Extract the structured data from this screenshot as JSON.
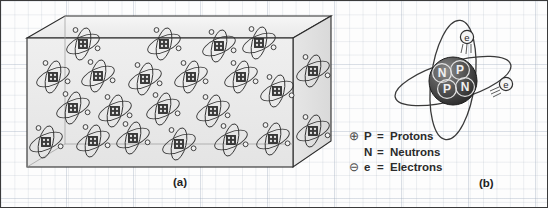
{
  "figure": {
    "background": {
      "style": "graph-paper-grid",
      "paper_color": "#fdfdfd",
      "grid_color": "#aab4c3",
      "border_color": "#3a3a3a"
    },
    "panels": [
      {
        "id": "a",
        "label": "(a)",
        "description": "Three-dimensional block of material filled with atoms",
        "shape": "rectangular-box-perspective",
        "fill_color": "#ececec",
        "edge_color": "#2b2b2b",
        "atom_count_front": 20,
        "atom_count_side": 2,
        "atom": {
          "nucleus_shape": "square",
          "nucleus_color": "#2f2f2f",
          "orbit_count": 2,
          "electron_count": 2
        }
      },
      {
        "id": "b",
        "label": "(b)",
        "description": "Single atom showing nucleus with protons and neutrons plus orbiting electrons",
        "nucleus": {
          "shape": "sphere",
          "color": "#3d3d3d",
          "particles": [
            {
              "symbol": "N",
              "row": 0,
              "col": 0
            },
            {
              "symbol": "P",
              "row": 0,
              "col": 1
            },
            {
              "symbol": "P",
              "row": 1,
              "col": 0
            },
            {
              "symbol": "N",
              "row": 1,
              "col": 1
            }
          ]
        },
        "electrons": [
          {
            "symbol": "e",
            "position": "upper"
          },
          {
            "symbol": "e",
            "position": "right"
          }
        ],
        "orbit_count": 2
      }
    ],
    "legend": {
      "items": [
        {
          "icon": "circle-plus-icon",
          "glyph": "⊕",
          "symbol": "P",
          "equals": "=",
          "name": "Protons"
        },
        {
          "icon": "none",
          "glyph": "",
          "symbol": "N",
          "equals": "=",
          "name": "Neutrons"
        },
        {
          "icon": "circle-minus-icon",
          "glyph": "⊖",
          "symbol": "e",
          "equals": "=",
          "name": "Electrons"
        }
      ]
    }
  }
}
